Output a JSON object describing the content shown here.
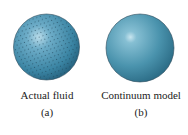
{
  "figures": [
    {
      "id": "a",
      "caption": "Actual fluid",
      "sublabel": "(a)",
      "style": "dotted-sphere",
      "color": "#3f8aa8"
    },
    {
      "id": "b",
      "caption": "Continuum model",
      "sublabel": "(b)",
      "style": "smooth-sphere",
      "color": "#4a93ad"
    }
  ]
}
